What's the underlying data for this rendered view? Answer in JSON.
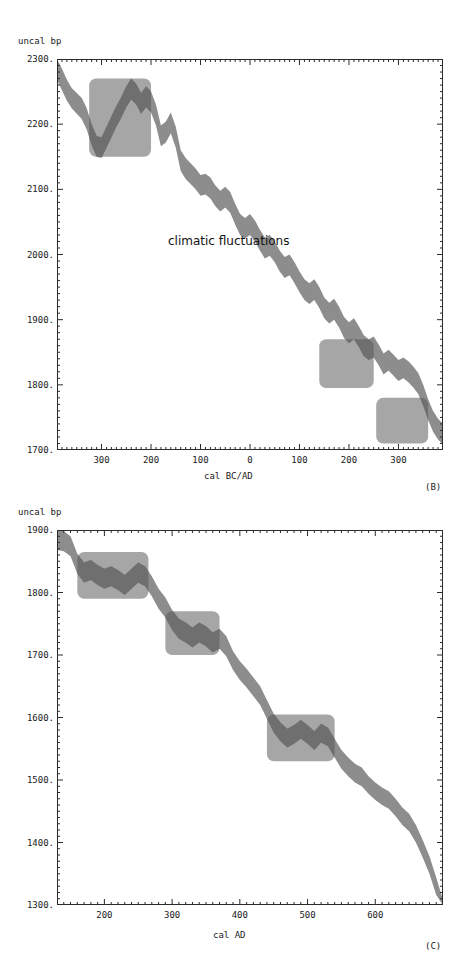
{
  "figure": {
    "panels": [
      {
        "id": "B",
        "letter": "(B)",
        "y_axis_title": "uncal bp",
        "x_axis_title": "cal BC/AD",
        "annotation": "climatic fluctuations",
        "yticks": [
          "2300.",
          "2200.",
          "2100.",
          "2000.",
          "1900.",
          "1800.",
          "1700."
        ],
        "xticks": [
          "300",
          "200",
          "100",
          "0",
          "100",
          "200",
          "300"
        ]
      },
      {
        "id": "C",
        "letter": "(C)",
        "y_axis_title": "uncal bp",
        "x_axis_title": "cal AD",
        "annotation": "",
        "yticks": [
          "1900.",
          "1800.",
          "1700.",
          "1600.",
          "1500.",
          "1400.",
          "1300."
        ],
        "xticks": [
          "200",
          "300",
          "400",
          "500",
          "600"
        ]
      }
    ]
  },
  "colors": {
    "curve_band": "#8d8d8d",
    "curve_band_in_box": "#6f6f6f",
    "highlight_box": "#a6a6a6",
    "axis": "#2b2b2b",
    "background": "#ffffff",
    "text": "#1a1a1a"
  },
  "chart_data": [
    {
      "type": "area",
      "title": "",
      "panel": "B",
      "xlabel": "cal BC/AD",
      "ylabel": "uncal bp",
      "xlim": [
        -390,
        390
      ],
      "ylim": [
        1700,
        2300
      ],
      "xtick_values": [
        -300,
        -200,
        -100,
        0,
        100,
        200,
        300
      ],
      "xtick_labels": [
        "300",
        "200",
        "100",
        "0",
        "100",
        "200",
        "300"
      ],
      "ytick_values": [
        1700,
        1800,
        1900,
        2000,
        2100,
        2200,
        2300
      ],
      "ytick_labels": [
        "1700.",
        "1800.",
        "1900.",
        "2000.",
        "2100.",
        "2200.",
        "2300."
      ],
      "minor_tick_step_x": 10,
      "minor_tick_step_y": 10,
      "grid": false,
      "legend": "none",
      "annotations": [
        {
          "text": "climatic fluctuations",
          "x": -55,
          "y": 2010
        }
      ],
      "highlight_boxes": [
        {
          "x0": -325,
          "x1": -200,
          "y0": 2150,
          "y1": 2270
        },
        {
          "x0": 140,
          "x1": 250,
          "y0": 1795,
          "y1": 1870
        },
        {
          "x0": 255,
          "x1": 360,
          "y0": 1710,
          "y1": 1780
        }
      ],
      "series": [
        {
          "name": "calibration curve (upper envelope)",
          "x": [
            -390,
            -380,
            -370,
            -360,
            -350,
            -340,
            -330,
            -320,
            -310,
            -300,
            -290,
            -280,
            -270,
            -260,
            -250,
            -240,
            -230,
            -220,
            -210,
            -200,
            -190,
            -180,
            -170,
            -160,
            -150,
            -140,
            -130,
            -120,
            -110,
            -100,
            -90,
            -80,
            -70,
            -60,
            -50,
            -40,
            -30,
            -20,
            -10,
            0,
            10,
            20,
            30,
            40,
            50,
            60,
            70,
            80,
            90,
            100,
            110,
            120,
            130,
            140,
            150,
            160,
            170,
            180,
            190,
            200,
            210,
            220,
            230,
            240,
            250,
            260,
            270,
            280,
            290,
            300,
            310,
            320,
            330,
            340,
            350,
            360,
            370,
            380,
            390
          ],
          "values": [
            2300,
            2285,
            2268,
            2255,
            2248,
            2240,
            2225,
            2200,
            2182,
            2180,
            2196,
            2212,
            2228,
            2242,
            2258,
            2270,
            2262,
            2248,
            2258,
            2250,
            2230,
            2198,
            2204,
            2218,
            2196,
            2160,
            2148,
            2140,
            2132,
            2122,
            2124,
            2118,
            2106,
            2098,
            2104,
            2096,
            2078,
            2062,
            2056,
            2062,
            2052,
            2038,
            2026,
            2030,
            2020,
            2006,
            1996,
            2000,
            1988,
            1974,
            1962,
            1956,
            1962,
            1950,
            1934,
            1926,
            1932,
            1920,
            1904,
            1896,
            1902,
            1890,
            1876,
            1870,
            1874,
            1862,
            1848,
            1854,
            1846,
            1838,
            1842,
            1836,
            1828,
            1818,
            1800,
            1778,
            1760,
            1748,
            1740
          ]
        },
        {
          "name": "calibration curve (lower envelope)",
          "x": [
            -390,
            -380,
            -370,
            -360,
            -350,
            -340,
            -330,
            -320,
            -310,
            -300,
            -290,
            -280,
            -270,
            -260,
            -250,
            -240,
            -230,
            -220,
            -210,
            -200,
            -190,
            -180,
            -170,
            -160,
            -150,
            -140,
            -130,
            -120,
            -110,
            -100,
            -90,
            -80,
            -70,
            -60,
            -50,
            -40,
            -30,
            -20,
            -10,
            0,
            10,
            20,
            30,
            40,
            50,
            60,
            70,
            80,
            90,
            100,
            110,
            120,
            130,
            140,
            150,
            160,
            170,
            180,
            190,
            200,
            210,
            220,
            230,
            240,
            250,
            260,
            270,
            280,
            290,
            300,
            310,
            320,
            330,
            340,
            350,
            360,
            370,
            380,
            390
          ],
          "values": [
            2268,
            2252,
            2236,
            2224,
            2216,
            2208,
            2192,
            2168,
            2150,
            2148,
            2164,
            2180,
            2196,
            2210,
            2226,
            2238,
            2230,
            2216,
            2226,
            2218,
            2198,
            2166,
            2172,
            2186,
            2164,
            2128,
            2116,
            2108,
            2100,
            2090,
            2092,
            2086,
            2074,
            2066,
            2072,
            2064,
            2046,
            2030,
            2024,
            2030,
            2020,
            2006,
            1994,
            1998,
            1988,
            1974,
            1964,
            1968,
            1956,
            1942,
            1930,
            1924,
            1930,
            1918,
            1902,
            1894,
            1900,
            1888,
            1872,
            1864,
            1870,
            1858,
            1844,
            1838,
            1842,
            1830,
            1816,
            1822,
            1814,
            1806,
            1810,
            1804,
            1796,
            1786,
            1768,
            1746,
            1728,
            1716,
            1708
          ]
        }
      ]
    },
    {
      "type": "area",
      "title": "",
      "panel": "C",
      "xlabel": "cal AD",
      "ylabel": "uncal bp",
      "xlim": [
        130,
        700
      ],
      "ylim": [
        1300,
        1900
      ],
      "xtick_values": [
        200,
        300,
        400,
        500,
        600
      ],
      "xtick_labels": [
        "200",
        "300",
        "400",
        "500",
        "600"
      ],
      "ytick_values": [
        1300,
        1400,
        1500,
        1600,
        1700,
        1800,
        1900
      ],
      "ytick_labels": [
        "1300.",
        "1400.",
        "1500.",
        "1600.",
        "1700.",
        "1800.",
        "1900."
      ],
      "minor_tick_step_x": 10,
      "minor_tick_step_y": 10,
      "grid": false,
      "legend": "none",
      "annotations": [],
      "highlight_boxes": [
        {
          "x0": 160,
          "x1": 265,
          "y0": 1790,
          "y1": 1865
        },
        {
          "x0": 290,
          "x1": 370,
          "y0": 1700,
          "y1": 1770
        },
        {
          "x0": 440,
          "x1": 540,
          "y0": 1530,
          "y1": 1605
        }
      ],
      "series": [
        {
          "name": "calibration curve (upper envelope)",
          "x": [
            130,
            140,
            150,
            160,
            170,
            180,
            190,
            200,
            210,
            220,
            230,
            240,
            250,
            260,
            270,
            280,
            290,
            300,
            310,
            320,
            330,
            340,
            350,
            360,
            370,
            380,
            390,
            400,
            410,
            420,
            430,
            440,
            450,
            460,
            470,
            480,
            490,
            500,
            510,
            520,
            530,
            540,
            550,
            560,
            570,
            580,
            590,
            600,
            610,
            620,
            630,
            640,
            650,
            660,
            670,
            680,
            690,
            700
          ],
          "values": [
            1900,
            1898,
            1890,
            1862,
            1848,
            1852,
            1844,
            1838,
            1842,
            1836,
            1828,
            1838,
            1848,
            1842,
            1826,
            1806,
            1792,
            1772,
            1758,
            1752,
            1744,
            1752,
            1746,
            1736,
            1742,
            1730,
            1706,
            1690,
            1678,
            1664,
            1650,
            1628,
            1606,
            1592,
            1582,
            1588,
            1596,
            1588,
            1578,
            1590,
            1584,
            1566,
            1548,
            1536,
            1526,
            1520,
            1506,
            1496,
            1488,
            1482,
            1470,
            1456,
            1446,
            1428,
            1404,
            1378,
            1344,
            1308
          ]
        },
        {
          "name": "calibration curve (lower envelope)",
          "x": [
            130,
            140,
            150,
            160,
            170,
            180,
            190,
            200,
            210,
            220,
            230,
            240,
            250,
            260,
            270,
            280,
            290,
            300,
            310,
            320,
            330,
            340,
            350,
            360,
            370,
            380,
            390,
            400,
            410,
            420,
            430,
            440,
            450,
            460,
            470,
            480,
            490,
            500,
            510,
            520,
            530,
            540,
            550,
            560,
            570,
            580,
            590,
            600,
            610,
            620,
            630,
            640,
            650,
            660,
            670,
            680,
            690,
            700
          ],
          "values": [
            1868,
            1866,
            1858,
            1830,
            1816,
            1820,
            1812,
            1806,
            1810,
            1804,
            1796,
            1806,
            1816,
            1810,
            1794,
            1774,
            1760,
            1740,
            1726,
            1720,
            1712,
            1720,
            1714,
            1704,
            1710,
            1698,
            1676,
            1660,
            1648,
            1634,
            1620,
            1598,
            1576,
            1562,
            1552,
            1558,
            1566,
            1558,
            1548,
            1560,
            1554,
            1536,
            1518,
            1506,
            1496,
            1490,
            1478,
            1468,
            1460,
            1454,
            1442,
            1428,
            1418,
            1400,
            1376,
            1350,
            1316,
            1300
          ]
        }
      ]
    }
  ]
}
